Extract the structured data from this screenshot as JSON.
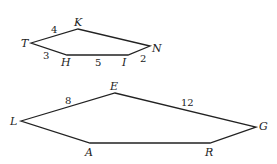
{
  "figure": {
    "top_pentagon": {
      "vertices": {
        "T": "T",
        "K": "K",
        "N": "N",
        "I": "I",
        "H": "H"
      },
      "sides": {
        "TK": "4",
        "TH": "3",
        "HI": "5",
        "IN": "2"
      }
    },
    "bottom_pentagon": {
      "vertices": {
        "L": "L",
        "E": "E",
        "G": "G",
        "R": "R",
        "A": "A"
      },
      "sides": {
        "LE": "8",
        "EG": "12"
      }
    },
    "stroke_color": "#222222"
  }
}
